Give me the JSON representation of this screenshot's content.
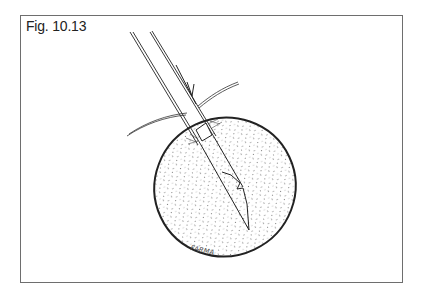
{
  "figure": {
    "label": "Fig. 10.13",
    "signature": "FARMA",
    "colors": {
      "frame_border": "#6e6e6e",
      "ink": "#222222",
      "background": "#ffffff"
    }
  }
}
